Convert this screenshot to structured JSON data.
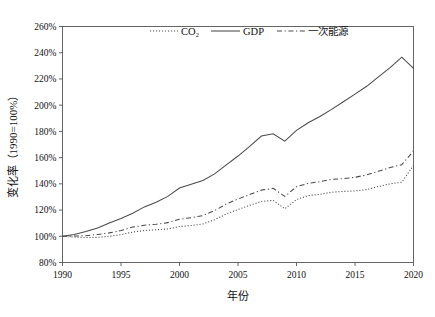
{
  "chart_data": {
    "type": "line",
    "title": "",
    "xlabel": "年份",
    "ylabel": "变化率（1990=100%）",
    "xlim": [
      1990,
      2020
    ],
    "ylim": [
      80,
      260
    ],
    "ytick_step": 20,
    "xtick_step": 5,
    "grid": false,
    "legend_position": "top-center",
    "xticks": [
      "1990",
      "1995",
      "2000",
      "2005",
      "2010",
      "2015",
      "2020"
    ],
    "yticks": [
      "80%",
      "100%",
      "120%",
      "140%",
      "160%",
      "180%",
      "200%",
      "220%",
      "240%",
      "260%"
    ],
    "x": [
      1990,
      1991,
      1992,
      1993,
      1994,
      1995,
      1996,
      1997,
      1998,
      1999,
      2000,
      2001,
      2002,
      2003,
      2004,
      2005,
      2006,
      2007,
      2008,
      2009,
      2010,
      2011,
      2012,
      2013,
      2014,
      2015,
      2016,
      2017,
      2018,
      2019,
      2020
    ],
    "series": [
      {
        "name": "CO₂",
        "style": "dotted",
        "values": [
          100,
          99.4,
          99.0,
          99.2,
          100.0,
          101.2,
          103.2,
          104.4,
          105.0,
          105.6,
          107.4,
          108.2,
          109.4,
          112.6,
          117.0,
          120.4,
          123.6,
          126.6,
          127.4,
          121.0,
          128.0,
          131.0,
          132.0,
          133.6,
          134.2,
          134.6,
          135.6,
          138.0,
          140.0,
          141.2,
          154.0
        ]
      },
      {
        "name": "GDP",
        "style": "solid",
        "values": [
          100,
          101.4,
          103.6,
          106.4,
          110.2,
          113.6,
          117.6,
          122.4,
          126.0,
          130.4,
          136.8,
          139.6,
          142.6,
          147.6,
          154.4,
          161.2,
          168.6,
          176.4,
          178.2,
          172.6,
          180.8,
          186.6,
          191.4,
          196.8,
          202.6,
          208.4,
          214.4,
          221.6,
          228.6,
          236.6,
          228.0
        ]
      },
      {
        "name": "一次能源",
        "style": "dash-dot",
        "values": [
          100,
          100.2,
          100.4,
          101.4,
          102.6,
          104.4,
          107.0,
          108.4,
          109.2,
          110.4,
          113.0,
          114.2,
          115.8,
          119.6,
          124.6,
          128.4,
          131.8,
          135.2,
          136.6,
          130.4,
          137.8,
          140.4,
          141.6,
          143.4,
          144.0,
          145.0,
          146.8,
          149.6,
          152.4,
          154.6,
          165.0
        ]
      }
    ]
  },
  "legend": {
    "items": [
      {
        "label": "CO₂"
      },
      {
        "label": "GDP"
      },
      {
        "label": "一次能源"
      }
    ]
  },
  "axes": {
    "x_title": "年份",
    "y_title": "变化率（1990=100%）"
  },
  "colors": {
    "line": "#4a4a4a",
    "frame": "#555555",
    "text": "#111111",
    "background": "#ffffff"
  }
}
